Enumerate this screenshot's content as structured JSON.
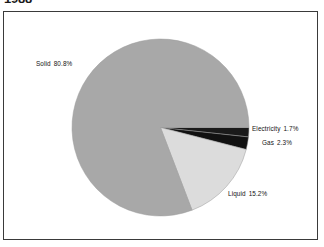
{
  "title": "1988",
  "chart_data": {
    "type": "pie",
    "title": "1988",
    "xlabel": "",
    "ylabel": "",
    "legend_position": "none",
    "grid": false,
    "units": "percent",
    "start_angle_deg": 0,
    "direction": "clockwise",
    "categories": [
      "Electricity",
      "Gas",
      "Liquid",
      "Solid"
    ],
    "values": [
      1.7,
      2.3,
      15.2,
      80.8
    ],
    "labels": [
      "Electricity  1.7%",
      "Gas  2.3%",
      "Liquid  15.2%",
      "Solid  80.8%"
    ],
    "colors": [
      "#1a1a1a",
      "#111111",
      "#dcdcdc",
      "#a8a8a8"
    ],
    "slices": [
      {
        "name": "Electricity",
        "value": 1.7,
        "value_text": "1.7%",
        "label": "Electricity  1.7%",
        "color": "#1a1a1a",
        "start_deg": 0.0,
        "end_deg": 6.12
      },
      {
        "name": "Gas",
        "value": 2.3,
        "value_text": "2.3%",
        "label": "Gas  2.3%",
        "color": "#111111",
        "start_deg": 6.12,
        "end_deg": 14.4
      },
      {
        "name": "Liquid",
        "value": 15.2,
        "value_text": "15.2%",
        "label": "Liquid  15.2%",
        "color": "#dcdcdc",
        "start_deg": 14.4,
        "end_deg": 69.12
      },
      {
        "name": "Solid",
        "value": 80.8,
        "value_text": "80.8%",
        "label": "Solid  80.8%",
        "color": "#a8a8a8",
        "start_deg": 69.12,
        "end_deg": 360.0
      }
    ]
  },
  "frame": {
    "border_color": "#3a3a3a",
    "background": "#ffffff"
  }
}
